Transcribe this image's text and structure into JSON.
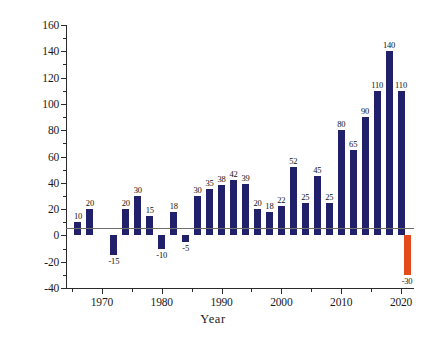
{
  "chart_data": {
    "type": "bar",
    "title": "",
    "xlabel": "Year",
    "ylabel": "Millions of Tonnes of CO2",
    "ylabel_base": "Millions of Tonnes of CO",
    "ylabel_sub": "2",
    "ylim": [
      -40,
      160
    ],
    "xlim": [
      1964,
      2022
    ],
    "y_ticks": [
      -40,
      -20,
      0,
      20,
      40,
      60,
      80,
      100,
      120,
      140,
      160
    ],
    "y_tick_labels": [
      "-40",
      "-20",
      "0",
      "20",
      "40",
      "60",
      "80",
      "100",
      "120",
      "140",
      "160"
    ],
    "x_ticks": [
      1970,
      1980,
      1990,
      2000,
      2010,
      2020
    ],
    "x_tick_labels": [
      "1970",
      "1980",
      "1990",
      "2000",
      "2010",
      "2020"
    ],
    "x_minor_ticks": [
      1965,
      1975,
      1985,
      1995,
      2005,
      2015
    ],
    "grid": false,
    "legend": false,
    "bar_color": "#21206b",
    "highlight_color": "#e54a1c",
    "x": [
      1966,
      1968,
      1972,
      1974,
      1976,
      1978,
      1980,
      1982,
      1984,
      1986,
      1988,
      1990,
      1992,
      1994,
      1996,
      1998,
      2000,
      2002,
      2004,
      2006,
      2008,
      2010,
      2012,
      2014,
      2016,
      2018,
      2020
    ],
    "values": [
      10,
      20,
      -15,
      20,
      30,
      15,
      -10,
      18,
      -5,
      30,
      35,
      38,
      42,
      39,
      20,
      18,
      22,
      52,
      25,
      45,
      25,
      80,
      65,
      90,
      110,
      140,
      110
    ],
    "value_labels": [
      "10",
      "20",
      "-15",
      "20",
      "30",
      "15",
      "-10",
      "18",
      "-5",
      "30",
      "35",
      "38",
      "42",
      "39",
      "20",
      "18",
      "22",
      "52",
      "25",
      "45",
      "25",
      "80",
      "65",
      "90",
      "110",
      "140",
      "110"
    ],
    "extra_bars": [
      {
        "x": 2021,
        "value": -30,
        "label": "-30",
        "color": "#e54a1c"
      }
    ]
  }
}
